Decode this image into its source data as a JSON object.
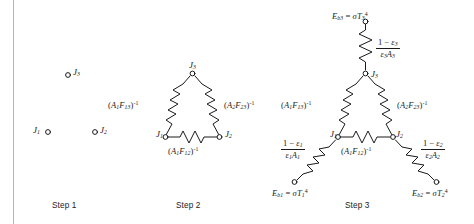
{
  "figure": {
    "background_color": "#ffffff",
    "ink_color": "#1a1a1a",
    "margin_rule_color": "#d4a7ab"
  },
  "captions": [
    {
      "id": "step1",
      "text": "Step 1"
    },
    {
      "id": "step2",
      "text": "Step 2"
    },
    {
      "id": "step3",
      "text": "Step 3"
    }
  ],
  "step1": {
    "nodes": [
      {
        "id": "J1",
        "label": "J",
        "sub": "1"
      },
      {
        "id": "J2",
        "label": "J",
        "sub": "2"
      },
      {
        "id": "J3",
        "label": "J",
        "sub": "3"
      }
    ]
  },
  "step2": {
    "nodes": [
      {
        "id": "J1",
        "label": "J",
        "sub": "1"
      },
      {
        "id": "J2",
        "label": "J",
        "sub": "2"
      },
      {
        "id": "J3",
        "label": "J",
        "sub": "3"
      }
    ],
    "resistors": [
      {
        "id": "R13",
        "base": "A",
        "base_sub": "1",
        "f": "F",
        "f_sub": "13",
        "exp": "-1"
      },
      {
        "id": "R23",
        "base": "A",
        "base_sub": "2",
        "f": "F",
        "f_sub": "23",
        "exp": "-1"
      },
      {
        "id": "R12",
        "base": "A",
        "base_sub": "1",
        "f": "F",
        "f_sub": "12",
        "exp": "-1"
      }
    ]
  },
  "step3": {
    "nodes": [
      {
        "id": "J1",
        "label": "J",
        "sub": "1"
      },
      {
        "id": "J2",
        "label": "J",
        "sub": "2"
      },
      {
        "id": "J3",
        "label": "J",
        "sub": "3"
      }
    ],
    "space_resistors": [
      {
        "id": "R13",
        "base": "A",
        "base_sub": "1",
        "f": "F",
        "f_sub": "13",
        "exp": "-1"
      },
      {
        "id": "R23",
        "base": "A",
        "base_sub": "2",
        "f": "F",
        "f_sub": "23",
        "exp": "-1"
      },
      {
        "id": "R12",
        "base": "A",
        "base_sub": "1",
        "f": "F",
        "f_sub": "12",
        "exp": "-1"
      }
    ],
    "surface_resistors": [
      {
        "id": "S1",
        "numerator_lead": "1 − ",
        "eps": "ε",
        "eps_sub": "1",
        "den_eps": "ε",
        "den_eps_sub": "1",
        "den_area": "A",
        "den_area_sub": "1"
      },
      {
        "id": "S2",
        "numerator_lead": "1 − ",
        "eps": "ε",
        "eps_sub": "2",
        "den_eps": "ε",
        "den_eps_sub": "2",
        "den_area": "A",
        "den_area_sub": "2"
      },
      {
        "id": "S3",
        "numerator_lead": "1 − ",
        "eps": "ε",
        "eps_sub": "3",
        "den_eps": "ε",
        "den_eps_sub": "3",
        "den_area": "A",
        "den_area_sub": "3"
      }
    ],
    "emissive_power_nodes": [
      {
        "id": "Eb1",
        "e": "E",
        "e_sub": "b1",
        "eq": " = ",
        "sigma": "σ",
        "t": "T",
        "t_sub": "1",
        "t_exp": "4"
      },
      {
        "id": "Eb2",
        "e": "E",
        "e_sub": "b2",
        "eq": " = ",
        "sigma": "σ",
        "t": "T",
        "t_sub": "2",
        "t_exp": "4"
      },
      {
        "id": "Eb3",
        "e": "E",
        "e_sub": "b3",
        "eq": " = ",
        "sigma": "σ",
        "t": "T",
        "t_sub": "3",
        "t_exp": "4"
      }
    ]
  }
}
